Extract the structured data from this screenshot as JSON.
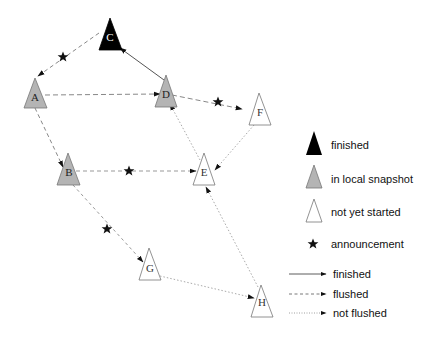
{
  "diagram": {
    "colors": {
      "finished": "#000000",
      "in_local_snapshot": "#b4b4b4",
      "not_yet_started": "#ffffff",
      "edge": "#777777",
      "stroke": "#666666"
    },
    "nodes": [
      {
        "id": "A",
        "label": "A",
        "state": "in_local_snapshot",
        "apex": [
          35,
          78
        ]
      },
      {
        "id": "B",
        "label": "B",
        "state": "in_local_snapshot",
        "apex": [
          68,
          153
        ]
      },
      {
        "id": "C",
        "label": "C",
        "state": "finished",
        "apex": [
          110,
          18
        ]
      },
      {
        "id": "D",
        "label": "D",
        "state": "in_local_snapshot",
        "apex": [
          166,
          75
        ]
      },
      {
        "id": "E",
        "label": "E",
        "state": "not_yet_started",
        "apex": [
          204,
          153
        ]
      },
      {
        "id": "F",
        "label": "F",
        "state": "not_yet_started",
        "apex": [
          259,
          93
        ]
      },
      {
        "id": "G",
        "label": "G",
        "state": "not_yet_started",
        "apex": [
          149,
          248
        ]
      },
      {
        "id": "H",
        "label": "H",
        "state": "not_yet_started",
        "apex": [
          261,
          285
        ]
      }
    ],
    "edges": [
      {
        "from": "C",
        "to": "A",
        "style": "flushed",
        "announcement": true
      },
      {
        "from": "D",
        "to": "C",
        "style": "finished",
        "announcement": false
      },
      {
        "from": "A",
        "to": "D",
        "style": "flushed",
        "announcement": false
      },
      {
        "from": "D",
        "to": "F",
        "style": "flushed",
        "announcement": true
      },
      {
        "from": "E",
        "to": "D",
        "style": "not_flushed",
        "announcement": false
      },
      {
        "from": "F",
        "to": "E",
        "style": "not_flushed",
        "announcement": false
      },
      {
        "from": "A",
        "to": "B",
        "style": "flushed",
        "announcement": false
      },
      {
        "from": "B",
        "to": "E",
        "style": "flushed",
        "announcement": true
      },
      {
        "from": "B",
        "to": "G",
        "style": "flushed",
        "announcement": true
      },
      {
        "from": "G",
        "to": "H",
        "style": "not_flushed",
        "announcement": false
      },
      {
        "from": "H",
        "to": "E",
        "style": "not_flushed",
        "announcement": false
      }
    ],
    "announcements": [
      {
        "on_edge": "C-A",
        "pos": [
          63,
          57
        ]
      },
      {
        "on_edge": "D-F",
        "pos": [
          218,
          102
        ]
      },
      {
        "on_edge": "B-E",
        "pos": [
          129,
          171
        ]
      },
      {
        "on_edge": "B-G",
        "pos": [
          107,
          229
        ]
      }
    ]
  },
  "legend": {
    "node_states": [
      {
        "key": "finished",
        "label": "finished"
      },
      {
        "key": "in_local_snapshot",
        "label": "in local snapshot"
      },
      {
        "key": "not_yet_started",
        "label": "not yet started"
      },
      {
        "key": "announcement",
        "label": "announcement"
      }
    ],
    "edge_styles": [
      {
        "key": "finished",
        "label": "finished"
      },
      {
        "key": "flushed",
        "label": "flushed"
      },
      {
        "key": "not_flushed",
        "label": "not flushed"
      }
    ]
  }
}
